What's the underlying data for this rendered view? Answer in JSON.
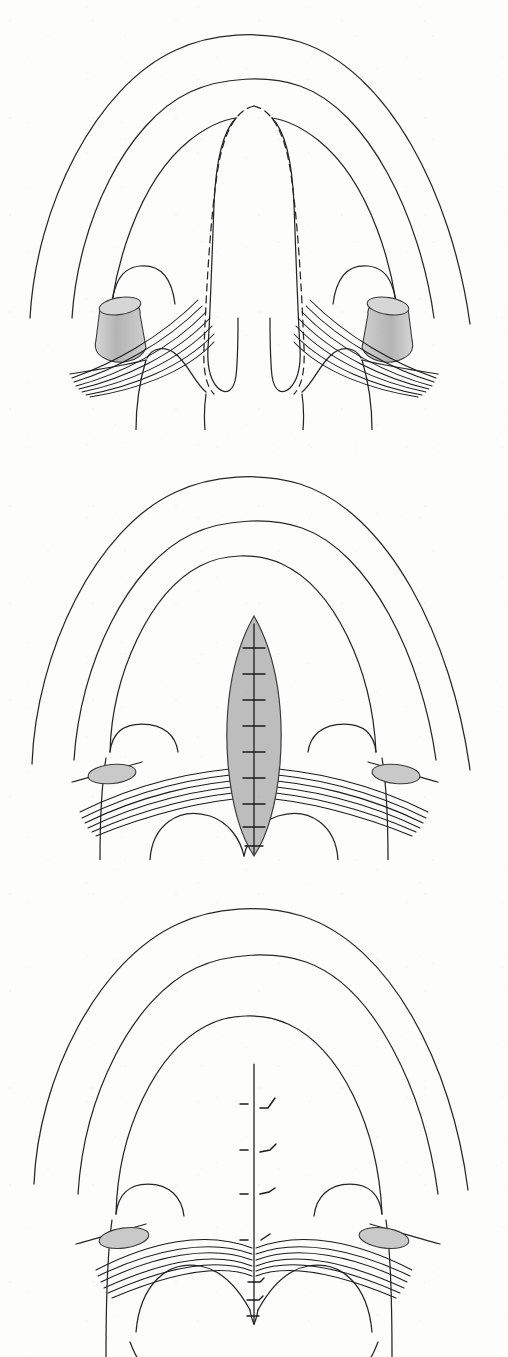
{
  "figure": {
    "kind": "anatomical-line-drawing",
    "panel_count": 3,
    "running_head": "",
    "orientation": "anterior at top, posterior at bottom"
  },
  "style": {
    "background": "#fdfdfc",
    "ink": "#1b1b1b",
    "outline_stroke": "#262626",
    "outline_width": 1.25,
    "muscle_stroke": "#1a1a1a",
    "muscle_width": 1.05,
    "shade_fill": "#bdbdbd",
    "shade_fill_light": "#c9c9c9",
    "shade_fill_dark": "#a8a8a8",
    "shade_stroke": "#3a3a3a",
    "dash_pattern": "7 5"
  },
  "panels": [
    {
      "id": "panel-1",
      "index": 1,
      "caption": "",
      "stage": "Unrepaired cleft of the secondary palate with planned incisions marked",
      "features": [
        "outer lip / cheek arch",
        "alveolar ridge arch",
        "hard palate margin arch",
        "bilateral cleft margins of the soft palate",
        "split uvula — two halves",
        "dashed planned incision line along each cleft margin",
        "hamulus of the medial pterygoid plate, both sides, shaded cylinder",
        "aberrant levator veli palatini fibres inserting onto the posterior hard palate margin",
        "posterior pharyngeal / tonsillar pillars"
      ],
      "shaded_structures": [
        {
          "name": "hamulus-left",
          "shape": "cylinder",
          "fill": "#bdbdbd"
        },
        {
          "name": "hamulus-right",
          "shape": "cylinder",
          "fill": "#bdbdbd"
        }
      ],
      "dashed_lines": 2,
      "muscle_bundles": 2,
      "muscle_strands_per_bundle": 7
    },
    {
      "id": "panel-2",
      "index": 2,
      "caption": "",
      "stage": "Midline closure — velar muscle released and retropositioned, cleft closed in the midline",
      "features": [
        "outer lip / cheek arch",
        "alveolar ridge arch",
        "hard palate margin arch",
        "shaded lens-shaped midline closure of the soft palate",
        "vertical midline suture line with interrupted sutures",
        "transverse levator sling reconstructed across the midline",
        "hamulus shown in cross-section as a small shaded oval, both sides",
        "tonsillar pillars"
      ],
      "shaded_structures": [
        {
          "name": "midline-closure-ellipse",
          "shape": "lens",
          "fill": "#bdbdbd"
        },
        {
          "name": "hamulus-oval-left",
          "shape": "ellipse",
          "fill": "#c9c9c9"
        },
        {
          "name": "hamulus-oval-right",
          "shape": "ellipse",
          "fill": "#c9c9c9"
        }
      ],
      "suture_count": 9,
      "muscle_bundles": 2,
      "muscle_strands_per_bundle": 6
    },
    {
      "id": "panel-3",
      "index": 3,
      "caption": "",
      "stage": "Completed repair — intact palate with midline suture line and knotted sutures",
      "features": [
        "outer lip / cheek arch",
        "alveolar ridge arch",
        "hard palate margin arch",
        "continuous midline suture line from hard palate to uvula",
        "four knotted sutures with tails on the upper midline",
        "levator sling meeting at the midline",
        "hamulus oval, both sides",
        "reconstructed uvula at the midline",
        "tonsillar pillars"
      ],
      "shaded_structures": [
        {
          "name": "hamulus-oval-left",
          "shape": "ellipse",
          "fill": "#c9c9c9"
        },
        {
          "name": "hamulus-oval-right",
          "shape": "ellipse",
          "fill": "#c9c9c9"
        }
      ],
      "knotted_sutures": 4,
      "uvula_sutures": 3,
      "muscle_bundles": 2,
      "muscle_strands_per_bundle": 6
    }
  ]
}
